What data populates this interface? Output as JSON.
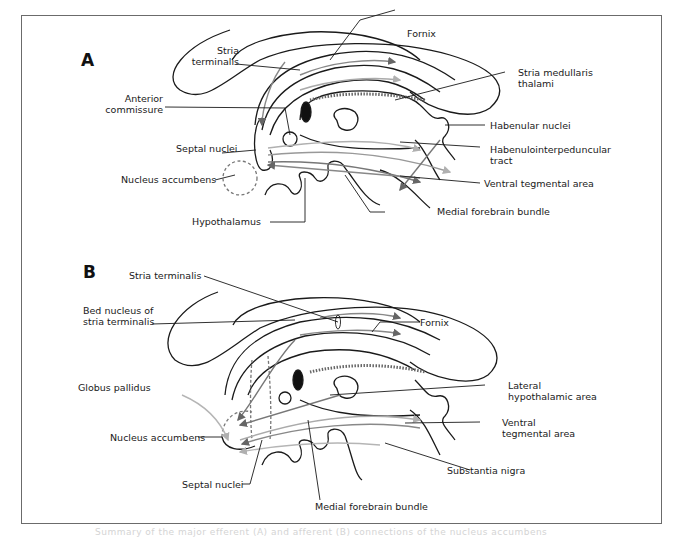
{
  "figure": {
    "panels": [
      {
        "id": "A",
        "letter": "A",
        "labels": {
          "stria_terminalis": "Stria terminalis",
          "fornix": "Fornix",
          "stria_medullaris_thalami": "Stria medullaris thalami",
          "anterior_commissure": "Anterior commissure",
          "septal_nuclei": "Septal nuclei",
          "habenular_nuclei": "Habenular nuclei",
          "habenulointerpeduncular_tract": "Habenulointerpeduncular tract",
          "nucleus_accumbens": "Nucleus accumbens",
          "ventral_tegmental_area": "Ventral tegmental area",
          "hypothalamus": "Hypothalamus",
          "medial_forebrain_bundle": "Medial forebrain bundle"
        }
      },
      {
        "id": "B",
        "letter": "B",
        "labels": {
          "stria_terminalis": "Stria terminalis",
          "bed_nucleus": "Bed nucleus of stria terminalis",
          "fornix": "Fornix",
          "globus_pallidus": "Globus pallidus",
          "lateral_hypothalamic_area": "Lateral hypothalamic area",
          "nucleus_accumbens": "Nucleus accumbens",
          "ventral_tegmental_area": "Ventral tegmental area",
          "substantia_nigra": "Substantia nigra",
          "septal_nuclei": "Septal nuclei",
          "medial_forebrain_bundle": "Medial forebrain bundle"
        }
      }
    ],
    "caption": "Summary of the major efferent (A) and afferent (B) connections of the nucleus accumbens",
    "colors": {
      "outline": "#1a1a1a",
      "pathway_dark": "#6e6e6e",
      "pathway_light": "#b5b5b5",
      "frame": "#6b6b6b"
    }
  }
}
